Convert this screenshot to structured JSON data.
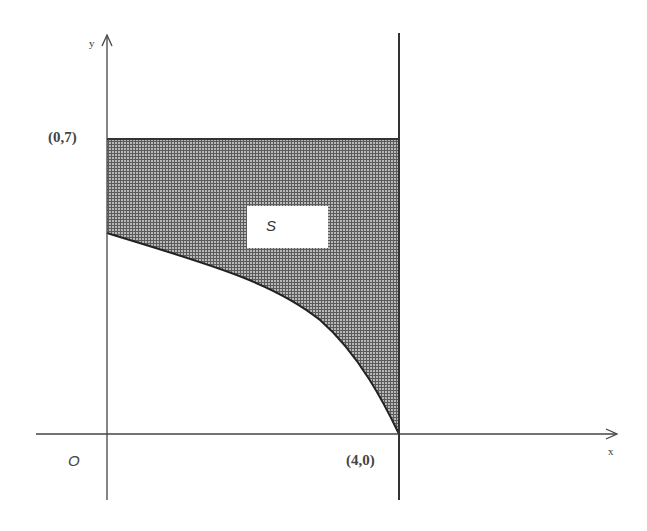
{
  "diagram": {
    "type": "region-between-curves",
    "axes": {
      "x_label": "x",
      "y_label": "y",
      "origin_label": "O"
    },
    "points": [
      {
        "label": "(0,7)",
        "x": 0,
        "y": 7
      },
      {
        "label": "(4,0)",
        "x": 4,
        "y": 0
      }
    ],
    "region": {
      "label": "S",
      "description": "Shaded region bounded above by y = 7, on the right by x = 4, on the left by the y-axis, and below by a decreasing concave-down curve from the y-axis to (4,0)"
    },
    "lines": [
      {
        "name": "horizontal-line",
        "equation": "y = 7"
      },
      {
        "name": "vertical-line",
        "equation": "x = 4"
      }
    ],
    "colors": {
      "stroke": "#333333",
      "fill_hatch": "#6e6e6e",
      "background": "#ffffff"
    }
  }
}
